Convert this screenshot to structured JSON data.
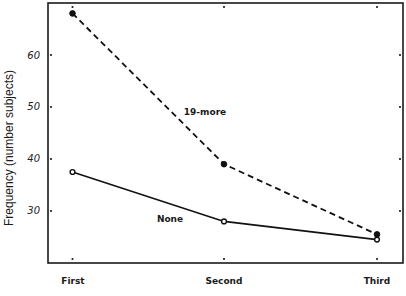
{
  "chart_data": {
    "type": "line",
    "title": "",
    "xlabel": "",
    "ylabel": "Frequency (number subjects)",
    "categories": [
      "First",
      "Second",
      "Third"
    ],
    "series": [
      {
        "name": "19-more",
        "style": "dashed",
        "marker": "filled-circle",
        "values": [
          68,
          39,
          25.5
        ]
      },
      {
        "name": "None",
        "style": "solid",
        "marker": "open-circle",
        "values": [
          37.5,
          28,
          24.5
        ]
      }
    ],
    "ylim": [
      20,
      70
    ],
    "yticks": [
      30,
      40,
      50,
      60
    ],
    "grid": false,
    "legend": "inline labels near lines"
  },
  "labels": {
    "ylabel": "Frequency (number subjects)",
    "series_19_more": "19-more",
    "series_none": "None",
    "cat_first": "First",
    "cat_second": "Second",
    "cat_third": "Third",
    "tick_30": "30",
    "tick_40": "40",
    "tick_50": "50",
    "tick_60": "60"
  }
}
